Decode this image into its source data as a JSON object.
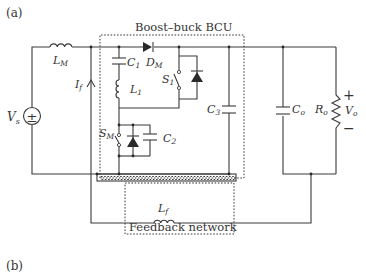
{
  "figure": {
    "panel_a_label": "(a)",
    "panel_b_label": "(b)"
  },
  "boxes": {
    "bcu_title": "Boost–buck BCU",
    "feedback_title": "Feedback network"
  },
  "components": {
    "source": {
      "name": "V",
      "sub": "s",
      "symbol": "±"
    },
    "main_inductor": {
      "name": "L",
      "sub": "M"
    },
    "feedback_current": {
      "name": "I",
      "sub": "f"
    },
    "c1": {
      "name": "C",
      "sub": "1"
    },
    "l1": {
      "name": "L",
      "sub": "1"
    },
    "dm": {
      "name": "D",
      "sub": "M"
    },
    "s1": {
      "name": "S",
      "sub": "1"
    },
    "sm": {
      "name": "S",
      "sub": "M"
    },
    "c2": {
      "name": "C",
      "sub": "2"
    },
    "c3": {
      "name": "C",
      "sub": "3"
    },
    "co": {
      "name": "C",
      "sub": "o"
    },
    "ro": {
      "name": "R",
      "sub": "o"
    },
    "vo": {
      "name": "V",
      "sub": "o",
      "plus": "+",
      "minus": "−"
    },
    "lf": {
      "name": "L",
      "sub": "f"
    }
  },
  "colors": {
    "line": "#3a3a3a",
    "text": "#333333",
    "background": "#ffffff"
  }
}
